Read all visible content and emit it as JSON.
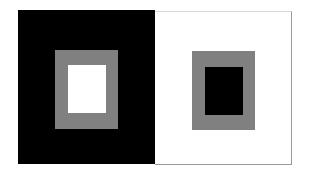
{
  "figure": {
    "colors": {
      "black": "#000000",
      "white": "#ffffff",
      "gray": "#808080",
      "border": "#a0a0a0"
    },
    "left_panel": {
      "background": "black",
      "outer_square": "gray",
      "inner_square": "white"
    },
    "right_panel": {
      "background": "white",
      "outer_square": "gray",
      "inner_square": "black"
    }
  }
}
